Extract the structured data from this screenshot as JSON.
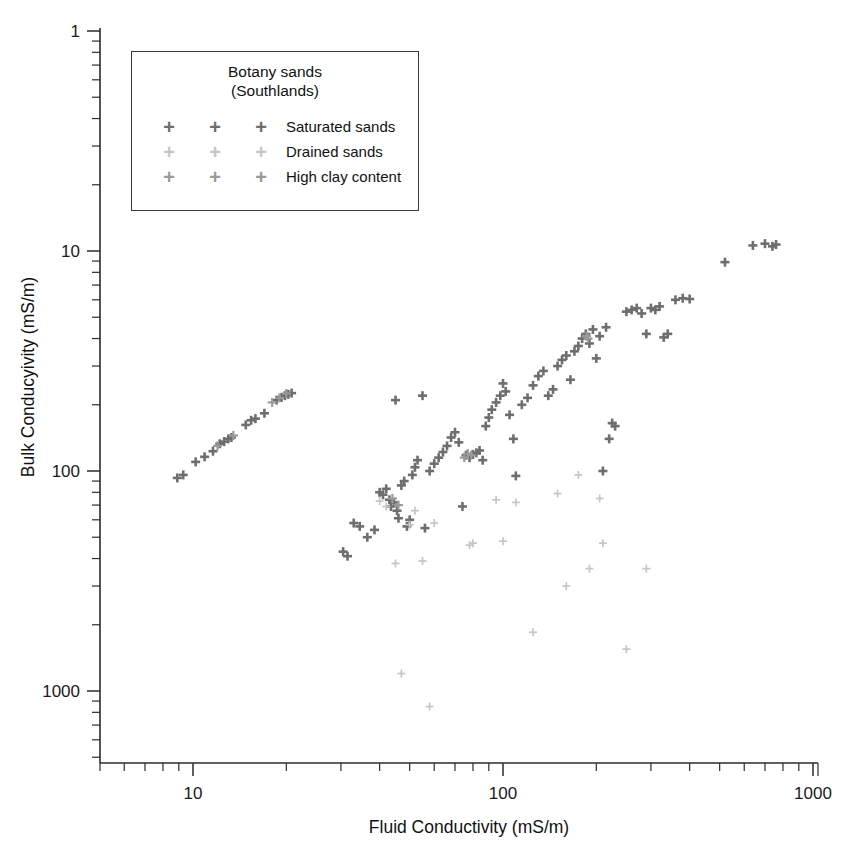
{
  "chart_data": {
    "type": "scatter",
    "title": "",
    "xlabel": "Fluid Conductivity (mS/m)",
    "ylabel": "Bulk Conducyivity (mS/m)",
    "xscale": "log",
    "yscale": "log",
    "xlim": [
      5,
      1000
    ],
    "ylim": [
      0.5,
      1000
    ],
    "xticks": [
      10,
      100,
      1000
    ],
    "xtick_labels": [
      "10",
      "100",
      "1000"
    ],
    "yticks": [
      1,
      10,
      100,
      1000
    ],
    "ytick_labels": [
      "1",
      "10",
      "100",
      "1000"
    ],
    "grid": false,
    "legend_position": "upper-left-inside",
    "marker": "plus",
    "series": [
      {
        "name": "Saturated sands",
        "color": "#6e6e6e",
        "marker_size": 9,
        "marker_weight": 2.6,
        "points": [
          [
            8.9,
            9.3
          ],
          [
            9.3,
            9.6
          ],
          [
            10.2,
            11.0
          ],
          [
            10.9,
            11.6
          ],
          [
            11.6,
            12.3
          ],
          [
            12.2,
            13.3
          ],
          [
            12.6,
            13.6
          ],
          [
            13.0,
            14.0
          ],
          [
            13.3,
            14.2
          ],
          [
            14.8,
            16.2
          ],
          [
            15.4,
            17.0
          ],
          [
            15.9,
            17.3
          ],
          [
            17.0,
            18.3
          ],
          [
            18.6,
            21.0
          ],
          [
            19.3,
            21.6
          ],
          [
            19.8,
            22.0
          ],
          [
            20.3,
            22.3
          ],
          [
            20.8,
            22.6
          ],
          [
            30.5,
            4.3
          ],
          [
            31.5,
            4.1
          ],
          [
            33.0,
            5.8
          ],
          [
            34.5,
            5.6
          ],
          [
            36.5,
            5.0
          ],
          [
            38.5,
            5.4
          ],
          [
            40.0,
            8.0
          ],
          [
            41.0,
            7.8
          ],
          [
            42.0,
            8.3
          ],
          [
            43.0,
            7.4
          ],
          [
            43.5,
            6.9
          ],
          [
            44.5,
            7.2
          ],
          [
            45.0,
            21.0
          ],
          [
            45.5,
            6.6
          ],
          [
            46.0,
            6.1
          ],
          [
            47.0,
            8.6
          ],
          [
            48.0,
            9.0
          ],
          [
            49.0,
            5.6
          ],
          [
            50.0,
            6.0
          ],
          [
            51.0,
            9.6
          ],
          [
            52.0,
            10.4
          ],
          [
            53.0,
            11.2
          ],
          [
            55.0,
            22.0
          ],
          [
            56.0,
            5.5
          ],
          [
            58.0,
            10.0
          ],
          [
            60.0,
            10.8
          ],
          [
            62.0,
            11.5
          ],
          [
            64.0,
            12.2
          ],
          [
            66.0,
            13.0
          ],
          [
            68.0,
            14.2
          ],
          [
            70.0,
            15.0
          ],
          [
            72.0,
            13.5
          ],
          [
            74.0,
            6.9
          ],
          [
            76.0,
            11.8
          ],
          [
            78.0,
            11.5
          ],
          [
            80.0,
            11.9
          ],
          [
            82.0,
            12.1
          ],
          [
            84.0,
            12.4
          ],
          [
            86.0,
            11.2
          ],
          [
            88.0,
            16.0
          ],
          [
            90.0,
            17.5
          ],
          [
            92.0,
            19.0
          ],
          [
            95.0,
            20.5
          ],
          [
            98.0,
            22.0
          ],
          [
            100.0,
            25.0
          ],
          [
            102.0,
            23.0
          ],
          [
            105.0,
            18.0
          ],
          [
            108.0,
            14.0
          ],
          [
            110.0,
            9.5
          ],
          [
            115.0,
            20.0
          ],
          [
            120.0,
            21.5
          ],
          [
            125.0,
            24.5
          ],
          [
            130.0,
            27.0
          ],
          [
            135.0,
            28.5
          ],
          [
            140.0,
            22.0
          ],
          [
            145.0,
            23.5
          ],
          [
            150.0,
            30.0
          ],
          [
            155.0,
            32.0
          ],
          [
            160.0,
            33.5
          ],
          [
            165.0,
            26.0
          ],
          [
            170.0,
            35.0
          ],
          [
            175.0,
            37.0
          ],
          [
            180.0,
            40.0
          ],
          [
            185.0,
            42.0
          ],
          [
            190.0,
            38.0
          ],
          [
            195.0,
            44.0
          ],
          [
            200.0,
            32.5
          ],
          [
            205.0,
            41.0
          ],
          [
            210.0,
            10.0
          ],
          [
            215.0,
            45.0
          ],
          [
            220.0,
            14.0
          ],
          [
            225.0,
            16.5
          ],
          [
            230.0,
            16.0
          ],
          [
            250.0,
            53.0
          ],
          [
            260.0,
            54.0
          ],
          [
            270.0,
            55.0
          ],
          [
            280.0,
            52.0
          ],
          [
            290.0,
            42.0
          ],
          [
            300.0,
            55.0
          ],
          [
            310.0,
            54.0
          ],
          [
            320.0,
            56.0
          ],
          [
            330.0,
            40.5
          ],
          [
            340.0,
            42.0
          ],
          [
            360.0,
            60.0
          ],
          [
            380.0,
            61.0
          ],
          [
            400.0,
            60.5
          ],
          [
            520.0,
            89.0
          ],
          [
            640.0,
            106.0
          ],
          [
            700.0,
            108.0
          ],
          [
            740.0,
            105.0
          ],
          [
            760.0,
            107.0
          ]
        ]
      },
      {
        "name": "Drained sands",
        "color": "#c6c6c6",
        "marker_size": 8,
        "marker_weight": 1.7,
        "points": [
          [
            40.0,
            7.3
          ],
          [
            42.0,
            6.9
          ],
          [
            45.0,
            3.8
          ],
          [
            47.0,
            1.2
          ],
          [
            50.0,
            5.7
          ],
          [
            52.0,
            6.6
          ],
          [
            55.0,
            3.9
          ],
          [
            58.0,
            0.85
          ],
          [
            60.0,
            5.8
          ],
          [
            78.0,
            4.6
          ],
          [
            80.0,
            4.7
          ],
          [
            95.0,
            7.4
          ],
          [
            100.0,
            4.8
          ],
          [
            110.0,
            7.2
          ],
          [
            125.0,
            1.85
          ],
          [
            150.0,
            7.9
          ],
          [
            160.0,
            3.0
          ],
          [
            175.0,
            9.6
          ],
          [
            190.0,
            3.6
          ],
          [
            205.0,
            7.5
          ],
          [
            210.0,
            4.7
          ],
          [
            250.0,
            1.55
          ],
          [
            290.0,
            3.6
          ]
        ]
      },
      {
        "name": "High clay content",
        "color": "#9a9a9a",
        "marker_size": 9,
        "marker_weight": 2.2,
        "points": [
          [
            12.0,
            13.0
          ],
          [
            13.5,
            14.5
          ],
          [
            18.0,
            20.5
          ],
          [
            19.0,
            21.5
          ],
          [
            20.0,
            22.5
          ],
          [
            44.0,
            7.5
          ],
          [
            46.0,
            7.0
          ],
          [
            75.0,
            11.5
          ],
          [
            77.0,
            12.0
          ],
          [
            79.0,
            11.8
          ],
          [
            186.0,
            41.0
          ],
          [
            188.0,
            40.0
          ]
        ]
      }
    ]
  },
  "legend": {
    "title_line1": "Botany sands",
    "title_line2": "(Southlands)",
    "rows": [
      {
        "label": "Saturated sands",
        "color": "#6e6e6e",
        "glyph": "+"
      },
      {
        "label": "Drained sands",
        "color": "#c6c6c6",
        "glyph": "+"
      },
      {
        "label": "High clay content",
        "color": "#9a9a9a",
        "glyph": "+"
      }
    ]
  },
  "axes": {
    "x_title": "Fluid Conductivity (mS/m)",
    "y_title": "Bulk Conducyivity (mS/m)",
    "x_tick_labels": [
      "10",
      "100",
      "1000"
    ],
    "y_tick_labels": [
      "1000",
      "100",
      "10",
      "1"
    ]
  }
}
